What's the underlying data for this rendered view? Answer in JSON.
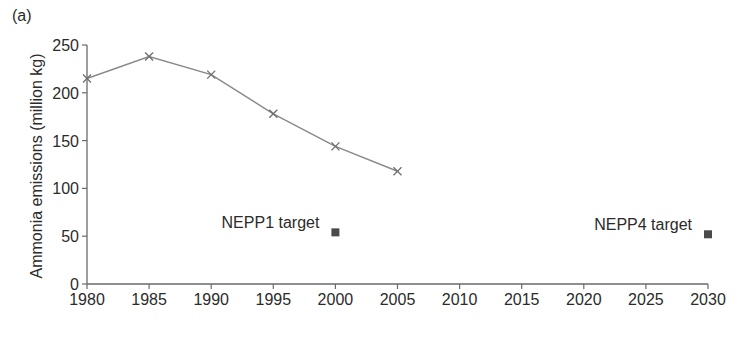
{
  "panel_label": "(a)",
  "chart_data": {
    "type": "line",
    "title": "",
    "xlabel": "",
    "ylabel": "Ammonia emissions (million kg)",
    "xlim": [
      1980,
      2030
    ],
    "ylim": [
      0,
      250
    ],
    "grid": false,
    "x_ticks": [
      1980,
      1985,
      1990,
      1995,
      2000,
      2005,
      2010,
      2015,
      2020,
      2025,
      2030
    ],
    "y_ticks": [
      0,
      50,
      100,
      150,
      200,
      250
    ],
    "series": [
      {
        "name": "Ammonia emissions",
        "marker": "x",
        "line": true,
        "color": "#6e6e6e",
        "x": [
          1980,
          1985,
          1990,
          1995,
          2000,
          2005
        ],
        "values": [
          215,
          238,
          219,
          178,
          144,
          118
        ]
      },
      {
        "name": "Targets",
        "marker": "square",
        "line": false,
        "color": "#4a4a4a",
        "x": [
          2000,
          2030
        ],
        "values": [
          54,
          52
        ]
      }
    ],
    "annotations": [
      {
        "text": "NEPP1 target",
        "x": 2000,
        "y": 54
      },
      {
        "text": "NEPP4 target",
        "x": 2030,
        "y": 52
      }
    ],
    "legend": null
  }
}
